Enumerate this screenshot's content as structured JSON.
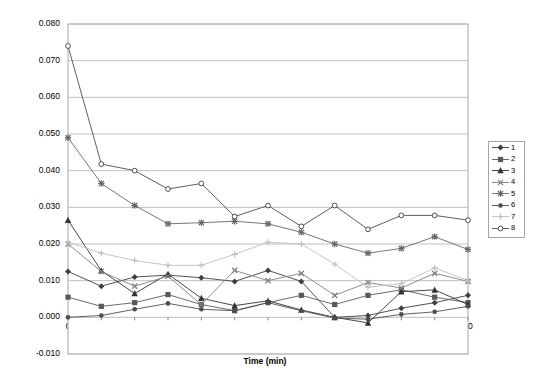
{
  "chart_data": {
    "type": "line",
    "title": "",
    "xlabel": "Time (min)",
    "ylabel": "counts x 10³ x sec⁻¹",
    "ylabel_parts": {
      "pre": "counts x 10",
      "sup1": "3",
      "mid": " x sec",
      "sup2": "-1"
    },
    "x": [
      0,
      5,
      10,
      15,
      20,
      25,
      30,
      35,
      40,
      45,
      50,
      55,
      60
    ],
    "xlim": [
      0,
      60
    ],
    "ylim": [
      -0.01,
      0.08
    ],
    "yticks": [
      "0.080",
      "0.070",
      "0.060",
      "0.050",
      "0.040",
      "0.030",
      "0.020",
      "0.010",
      "0.000",
      "-0.010"
    ],
    "ytick_values": [
      0.08,
      0.07,
      0.06,
      0.05,
      0.04,
      0.03,
      0.02,
      0.01,
      0.0,
      -0.01
    ],
    "xticks": [
      "0",
      "5",
      "10",
      "15",
      "20",
      "25",
      "30",
      "35",
      "40",
      "45",
      "50",
      "55",
      "60"
    ],
    "grid": "horizontal",
    "legend_position": "right",
    "series": [
      {
        "name": "1",
        "marker": "filled-diamond",
        "color": "#404040",
        "values": [
          0.0125,
          0.0085,
          0.011,
          0.0115,
          0.0108,
          0.0098,
          0.0128,
          0.0098,
          0.0,
          0.0005,
          0.0025,
          0.004,
          0.006
        ]
      },
      {
        "name": "2",
        "marker": "filled-square",
        "color": "#595959",
        "values": [
          0.0055,
          0.003,
          0.004,
          0.0062,
          0.0035,
          0.0018,
          0.004,
          0.006,
          0.0035,
          0.006,
          0.0075,
          0.0055,
          0.004
        ]
      },
      {
        "name": "3",
        "marker": "filled-triangle",
        "color": "#333333",
        "values": [
          0.0265,
          0.0127,
          0.0065,
          0.0118,
          0.0052,
          0.0032,
          0.0045,
          0.002,
          0.0,
          -0.0015,
          0.007,
          0.0075,
          0.0035
        ]
      },
      {
        "name": "4",
        "marker": "x-cross",
        "color": "#808080",
        "values": [
          0.02,
          0.0125,
          0.0085,
          0.0112,
          0.0035,
          0.0128,
          0.01,
          0.012,
          0.006,
          0.0095,
          0.008,
          0.012,
          0.0098
        ]
      },
      {
        "name": "5",
        "marker": "star-asterisk",
        "color": "#666666",
        "values": [
          0.049,
          0.0365,
          0.0305,
          0.0255,
          0.0258,
          0.0262,
          0.0255,
          0.0232,
          0.02,
          0.0175,
          0.0188,
          0.022,
          0.0185
        ]
      },
      {
        "name": "6",
        "marker": "filled-circle",
        "color": "#4d4d4d",
        "values": [
          0.0,
          0.0005,
          0.0022,
          0.0038,
          0.0022,
          0.0018,
          0.004,
          0.0018,
          -0.0002,
          -0.0005,
          0.0008,
          0.0015,
          0.003
        ]
      },
      {
        "name": "7",
        "marker": "plus-cross",
        "color": "#bfbfbf",
        "values": [
          0.0205,
          0.0175,
          0.0155,
          0.0142,
          0.0142,
          0.0172,
          0.0205,
          0.02,
          0.0145,
          0.0082,
          0.0092,
          0.0135,
          0.01
        ]
      },
      {
        "name": "8",
        "marker": "open-circle",
        "color": "#4d4d4d",
        "values": [
          0.074,
          0.0418,
          0.04,
          0.035,
          0.0365,
          0.0275,
          0.0305,
          0.0248,
          0.0305,
          0.024,
          0.0278,
          0.0278,
          0.0265
        ]
      }
    ]
  },
  "legend": {
    "items": [
      {
        "label": "1"
      },
      {
        "label": "2"
      },
      {
        "label": "3"
      },
      {
        "label": "4"
      },
      {
        "label": "5"
      },
      {
        "label": "6"
      },
      {
        "label": "7"
      },
      {
        "label": "8"
      }
    ]
  },
  "colors": {
    "plot_border": "#a6a6a6",
    "gridline": "#bfbfbf",
    "background": "#ffffff",
    "text": "#000000"
  }
}
